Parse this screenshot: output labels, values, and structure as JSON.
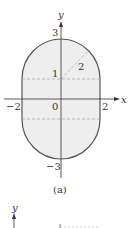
{
  "figure": {
    "caption": "(a)",
    "axes": {
      "x_label": "x",
      "y_label": "y",
      "x_ticks": [
        "−2",
        "0",
        "2"
      ],
      "y_ticks": [
        "3",
        "1",
        "−3"
      ]
    },
    "annotations": {
      "radius_label": "2",
      "center_label": "1"
    },
    "colors": {
      "fill": "#eeeeee",
      "outline": "#555555",
      "dashed": "#aaaaaa",
      "axis": "#333333"
    }
  },
  "second_figure": {
    "y_label": "y"
  }
}
